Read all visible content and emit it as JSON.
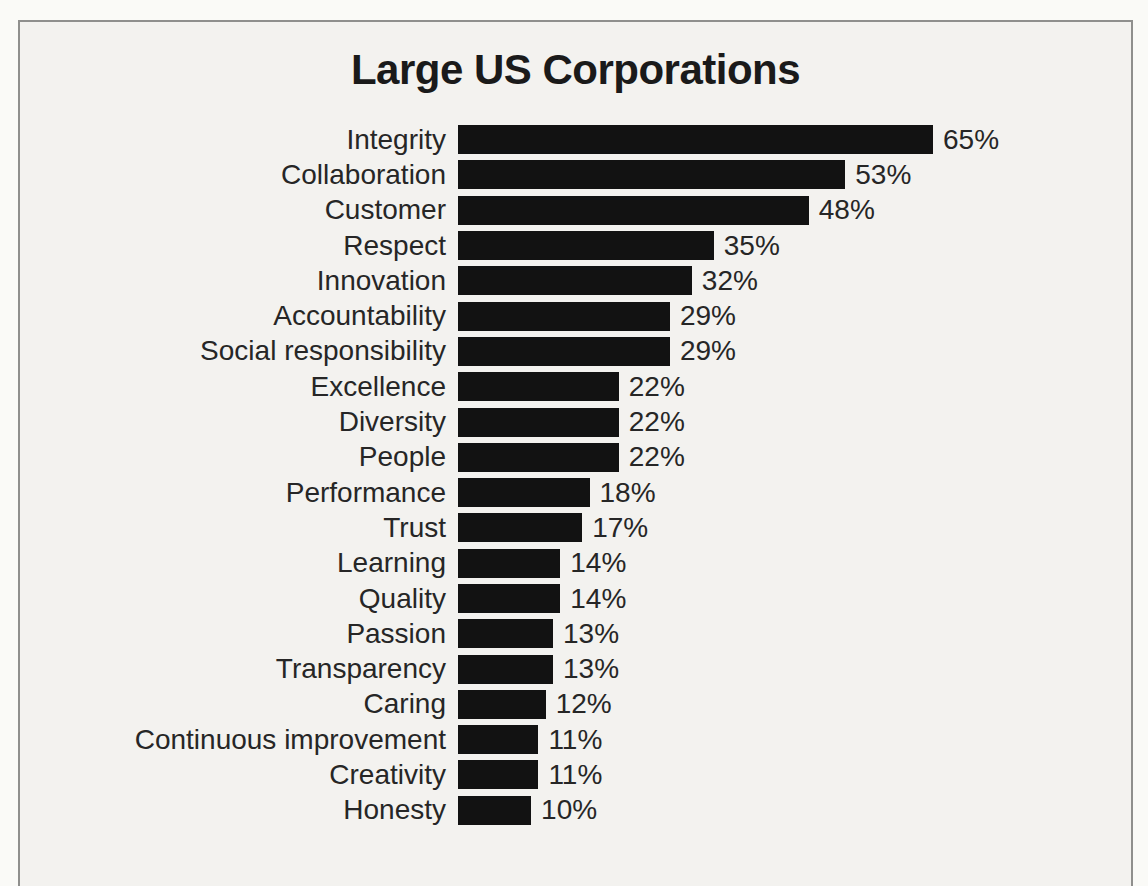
{
  "page": {
    "background_color": "#f3f2ef",
    "frame_border_color": "#8f8f8d"
  },
  "chart": {
    "title": "Large US Corporations",
    "bar_color": "#121212",
    "text_color": "#262626"
  },
  "chart_data": {
    "type": "bar",
    "orientation": "horizontal",
    "title": "Large US Corporations",
    "categories": [
      "Integrity",
      "Collaboration",
      "Customer",
      "Respect",
      "Innovation",
      "Accountability",
      "Social responsibility",
      "Excellence",
      "Diversity",
      "People",
      "Performance",
      "Trust",
      "Learning",
      "Quality",
      "Passion",
      "Transparency",
      "Caring",
      "Continuous improvement",
      "Creativity",
      "Honesty"
    ],
    "values": [
      65,
      53,
      48,
      35,
      32,
      29,
      29,
      22,
      22,
      22,
      18,
      17,
      14,
      14,
      13,
      13,
      12,
      11,
      11,
      10
    ],
    "value_labels": [
      "65%",
      "53%",
      "48%",
      "35%",
      "32%",
      "29%",
      "29%",
      "22%",
      "22%",
      "22%",
      "18%",
      "17%",
      "14%",
      "14%",
      "13%",
      "13%",
      "12%",
      "11%",
      "11%",
      "10%"
    ],
    "xlabel": "",
    "ylabel": "",
    "xlim": [
      0,
      65
    ],
    "max_bar_px": 475,
    "grid": false,
    "legend": null,
    "data_labels": "outside-end"
  }
}
